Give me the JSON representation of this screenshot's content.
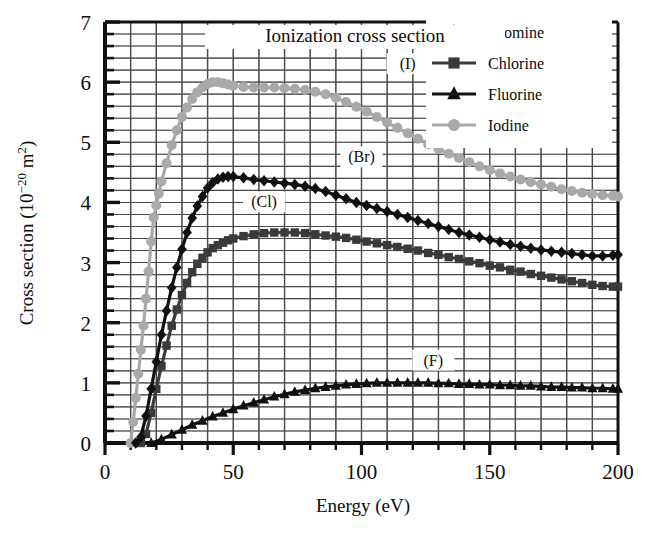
{
  "chart_data": {
    "type": "line",
    "title": "Ionization cross section",
    "xlabel": "Energy (eV)",
    "ylabel": "Cross section (10−20 m2)",
    "ylabel_parts": {
      "main": "Cross section (10",
      "exp": "−20",
      "unit": " m",
      "unit_exp": "2",
      "close": ")"
    },
    "xlim": [
      0,
      200
    ],
    "ylim": [
      0,
      7
    ],
    "x_ticks": [
      0,
      50,
      100,
      150,
      200
    ],
    "y_ticks": [
      0,
      1,
      2,
      3,
      4,
      5,
      6,
      7
    ],
    "x_minor_step": 10,
    "y_minor_step": 0.2,
    "grid": true,
    "legend_position": "top-right",
    "annotations": [
      {
        "label": "(I)",
        "x": 118,
        "y": 6.25
      },
      {
        "label": "(Br)",
        "x": 100,
        "y": 4.7
      },
      {
        "label": "(Cl)",
        "x": 62,
        "y": 3.95
      },
      {
        "label": "(F)",
        "x": 128,
        "y": 1.32
      }
    ],
    "series": [
      {
        "name": "Bromine",
        "tag": "(Br)",
        "color": "#101010",
        "marker": "diamond",
        "points": [
          [
            12,
            0.0
          ],
          [
            14,
            0.1
          ],
          [
            16,
            0.45
          ],
          [
            18,
            0.9
          ],
          [
            20,
            1.35
          ],
          [
            22,
            1.8
          ],
          [
            24,
            2.2
          ],
          [
            26,
            2.58
          ],
          [
            28,
            2.92
          ],
          [
            30,
            3.22
          ],
          [
            32,
            3.5
          ],
          [
            34,
            3.74
          ],
          [
            36,
            3.94
          ],
          [
            38,
            4.1
          ],
          [
            40,
            4.24
          ],
          [
            42,
            4.33
          ],
          [
            44,
            4.39
          ],
          [
            46,
            4.42
          ],
          [
            48,
            4.43
          ],
          [
            50,
            4.43
          ],
          [
            54,
            4.41
          ],
          [
            58,
            4.38
          ],
          [
            62,
            4.36
          ],
          [
            66,
            4.34
          ],
          [
            70,
            4.32
          ],
          [
            74,
            4.3
          ],
          [
            78,
            4.27
          ],
          [
            82,
            4.23
          ],
          [
            86,
            4.18
          ],
          [
            90,
            4.12
          ],
          [
            94,
            4.06
          ],
          [
            98,
            4.0
          ],
          [
            102,
            3.95
          ],
          [
            106,
            3.9
          ],
          [
            110,
            3.85
          ],
          [
            114,
            3.8
          ],
          [
            118,
            3.75
          ],
          [
            122,
            3.7
          ],
          [
            126,
            3.65
          ],
          [
            130,
            3.6
          ],
          [
            134,
            3.55
          ],
          [
            138,
            3.5
          ],
          [
            142,
            3.46
          ],
          [
            146,
            3.42
          ],
          [
            150,
            3.38
          ],
          [
            154,
            3.34
          ],
          [
            158,
            3.3
          ],
          [
            162,
            3.27
          ],
          [
            166,
            3.24
          ],
          [
            170,
            3.21
          ],
          [
            174,
            3.19
          ],
          [
            178,
            3.17
          ],
          [
            182,
            3.15
          ],
          [
            186,
            3.13
          ],
          [
            190,
            3.11
          ],
          [
            194,
            3.11
          ],
          [
            198,
            3.12
          ],
          [
            200,
            3.13
          ]
        ]
      },
      {
        "name": "Chlorine",
        "tag": "(Cl)",
        "color": "#3a3a3a",
        "marker": "square",
        "points": [
          [
            14,
            0.0
          ],
          [
            16,
            0.15
          ],
          [
            18,
            0.5
          ],
          [
            20,
            0.9
          ],
          [
            22,
            1.28
          ],
          [
            24,
            1.62
          ],
          [
            26,
            1.95
          ],
          [
            28,
            2.22
          ],
          [
            30,
            2.46
          ],
          [
            32,
            2.66
          ],
          [
            34,
            2.84
          ],
          [
            36,
            2.98
          ],
          [
            38,
            3.08
          ],
          [
            40,
            3.17
          ],
          [
            42,
            3.24
          ],
          [
            44,
            3.29
          ],
          [
            46,
            3.33
          ],
          [
            48,
            3.37
          ],
          [
            50,
            3.4
          ],
          [
            54,
            3.44
          ],
          [
            58,
            3.47
          ],
          [
            62,
            3.49
          ],
          [
            66,
            3.5
          ],
          [
            70,
            3.5
          ],
          [
            74,
            3.5
          ],
          [
            78,
            3.49
          ],
          [
            82,
            3.47
          ],
          [
            86,
            3.45
          ],
          [
            90,
            3.43
          ],
          [
            94,
            3.41
          ],
          [
            98,
            3.38
          ],
          [
            102,
            3.35
          ],
          [
            106,
            3.32
          ],
          [
            110,
            3.29
          ],
          [
            114,
            3.26
          ],
          [
            118,
            3.23
          ],
          [
            122,
            3.2
          ],
          [
            126,
            3.16
          ],
          [
            130,
            3.13
          ],
          [
            134,
            3.09
          ],
          [
            138,
            3.06
          ],
          [
            142,
            3.02
          ],
          [
            146,
            2.99
          ],
          [
            150,
            2.95
          ],
          [
            154,
            2.92
          ],
          [
            158,
            2.88
          ],
          [
            162,
            2.85
          ],
          [
            166,
            2.81
          ],
          [
            170,
            2.78
          ],
          [
            174,
            2.75
          ],
          [
            178,
            2.72
          ],
          [
            182,
            2.69
          ],
          [
            186,
            2.66
          ],
          [
            190,
            2.63
          ],
          [
            194,
            2.61
          ],
          [
            198,
            2.6
          ],
          [
            200,
            2.6
          ]
        ]
      },
      {
        "name": "Fluorine",
        "tag": "(F)",
        "color": "#101010",
        "marker": "triangle",
        "points": [
          [
            18,
            0.0
          ],
          [
            22,
            0.06
          ],
          [
            26,
            0.14
          ],
          [
            30,
            0.22
          ],
          [
            34,
            0.3
          ],
          [
            38,
            0.37
          ],
          [
            42,
            0.44
          ],
          [
            46,
            0.5
          ],
          [
            50,
            0.56
          ],
          [
            54,
            0.62
          ],
          [
            58,
            0.67
          ],
          [
            62,
            0.72
          ],
          [
            66,
            0.77
          ],
          [
            70,
            0.81
          ],
          [
            74,
            0.85
          ],
          [
            78,
            0.88
          ],
          [
            82,
            0.91
          ],
          [
            86,
            0.93
          ],
          [
            90,
            0.95
          ],
          [
            94,
            0.97
          ],
          [
            98,
            0.98
          ],
          [
            102,
            0.99
          ],
          [
            106,
            1.0
          ],
          [
            110,
            1.0
          ],
          [
            114,
            1.0
          ],
          [
            118,
            1.0
          ],
          [
            122,
            1.0
          ],
          [
            126,
            1.0
          ],
          [
            130,
            0.99
          ],
          [
            134,
            0.99
          ],
          [
            138,
            0.98
          ],
          [
            142,
            0.98
          ],
          [
            146,
            0.97
          ],
          [
            150,
            0.97
          ],
          [
            154,
            0.96
          ],
          [
            158,
            0.96
          ],
          [
            162,
            0.95
          ],
          [
            166,
            0.95
          ],
          [
            170,
            0.94
          ],
          [
            174,
            0.93
          ],
          [
            178,
            0.93
          ],
          [
            182,
            0.92
          ],
          [
            186,
            0.92
          ],
          [
            190,
            0.91
          ],
          [
            194,
            0.91
          ],
          [
            198,
            0.9
          ],
          [
            200,
            0.9
          ]
        ]
      },
      {
        "name": "Iodine",
        "tag": "(I)",
        "color": "#a9a9a9",
        "marker": "circle",
        "points": [
          [
            10,
            0.0
          ],
          [
            11,
            0.35
          ],
          [
            12,
            0.75
          ],
          [
            13,
            1.15
          ],
          [
            14,
            1.55
          ],
          [
            15,
            1.95
          ],
          [
            16,
            2.4
          ],
          [
            17,
            2.85
          ],
          [
            18,
            3.35
          ],
          [
            19,
            3.75
          ],
          [
            20,
            3.95
          ],
          [
            21,
            4.15
          ],
          [
            22,
            4.35
          ],
          [
            24,
            4.65
          ],
          [
            26,
            4.95
          ],
          [
            28,
            5.2
          ],
          [
            30,
            5.42
          ],
          [
            32,
            5.58
          ],
          [
            34,
            5.72
          ],
          [
            36,
            5.83
          ],
          [
            38,
            5.91
          ],
          [
            40,
            5.97
          ],
          [
            42,
            6.0
          ],
          [
            44,
            6.0
          ],
          [
            46,
            5.98
          ],
          [
            48,
            5.96
          ],
          [
            50,
            5.94
          ],
          [
            54,
            5.92
          ],
          [
            58,
            5.91
          ],
          [
            62,
            5.91
          ],
          [
            66,
            5.91
          ],
          [
            70,
            5.9
          ],
          [
            74,
            5.89
          ],
          [
            78,
            5.87
          ],
          [
            82,
            5.84
          ],
          [
            86,
            5.8
          ],
          [
            90,
            5.74
          ],
          [
            94,
            5.67
          ],
          [
            98,
            5.59
          ],
          [
            102,
            5.51
          ],
          [
            106,
            5.42
          ],
          [
            110,
            5.33
          ],
          [
            114,
            5.24
          ],
          [
            118,
            5.15
          ],
          [
            122,
            5.06
          ],
          [
            126,
            4.97
          ],
          [
            130,
            4.89
          ],
          [
            134,
            4.81
          ],
          [
            138,
            4.74
          ],
          [
            142,
            4.67
          ],
          [
            146,
            4.6
          ],
          [
            150,
            4.54
          ],
          [
            154,
            4.48
          ],
          [
            158,
            4.43
          ],
          [
            162,
            4.38
          ],
          [
            166,
            4.34
          ],
          [
            170,
            4.3
          ],
          [
            174,
            4.26
          ],
          [
            178,
            4.22
          ],
          [
            182,
            4.19
          ],
          [
            186,
            4.16
          ],
          [
            190,
            4.14
          ],
          [
            194,
            4.12
          ],
          [
            198,
            4.11
          ],
          [
            200,
            4.1
          ]
        ]
      }
    ]
  },
  "legend": {
    "entries": [
      {
        "label": "Bromine",
        "color": "#101010",
        "marker": "diamond"
      },
      {
        "label": "Chlorine",
        "color": "#3a3a3a",
        "marker": "square"
      },
      {
        "label": "Fluorine",
        "color": "#101010",
        "marker": "triangle"
      },
      {
        "label": "Iodine",
        "color": "#a9a9a9",
        "marker": "circle"
      }
    ]
  },
  "colors": {
    "axis": "#101010",
    "grid_major": "#4a4a4a",
    "grid_minor": "#9a9a9a",
    "background": "#ffffff",
    "bromine": "#101010",
    "chlorine": "#3a3a3a",
    "fluorine": "#101010",
    "iodine": "#a9a9a9"
  }
}
